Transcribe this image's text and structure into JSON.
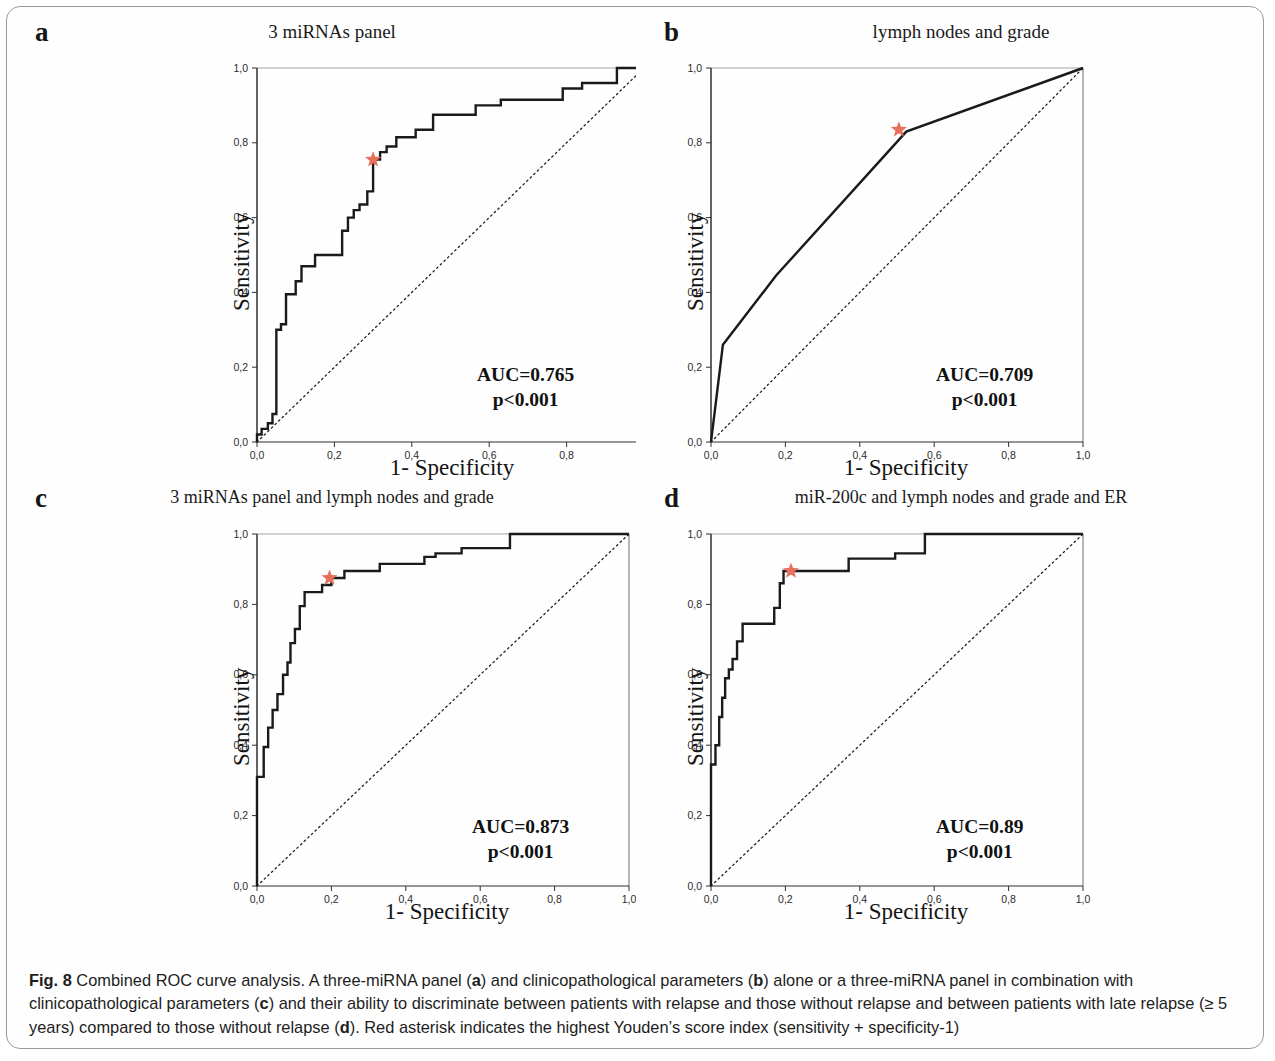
{
  "figure": {
    "caption_label": "Fig. 8",
    "caption_text_1": " Combined ROC curve analysis. A three-miRNA panel (",
    "caption_a": "a",
    "caption_text_2": ") and clinicopathological parameters (",
    "caption_b": "b",
    "caption_text_3": ") alone or a three-miRNA panel in combination with clinicopathological parameters (",
    "caption_c": "c",
    "caption_text_4": ") and their ability to discriminate between patients with relapse and those without relapse and between patients with late relapse (≥ 5 years) compared to those without relapse (",
    "caption_d": "d",
    "caption_text_5": "). Red asterisk indicates the highest Youden’s score index (sensitivity + specificity-1)",
    "asterisk_color": "#e8705a",
    "curve_color": "#1a1a1a",
    "axis_color": "#444444"
  },
  "axes_common": {
    "xlabel": "1- Specificity",
    "ylabel": "Sensitivity",
    "xticks": [
      "0,0",
      "0,2",
      "0,4",
      "0,6",
      "0,8",
      "1,0"
    ],
    "yticks": [
      "0,0",
      "0,2",
      "0,4",
      "0,6",
      "0,8",
      "1,0"
    ],
    "xlim": [
      0,
      1
    ],
    "ylim": [
      0,
      1
    ],
    "grid": false
  },
  "chart_data": [
    {
      "type": "line",
      "panel": "a",
      "letter": "a",
      "title": "3 miRNAs panel",
      "xlabel": "1- Specificity",
      "ylabel": "Sensitivity",
      "xlim": [
        0,
        1
      ],
      "ylim": [
        0,
        1
      ],
      "auc_label": "AUC=0.765",
      "p_label": "p<0.001",
      "auc": 0.765,
      "reference_line": [
        [
          0,
          0
        ],
        [
          1,
          1
        ]
      ],
      "youden_marker": {
        "x": 0.3,
        "y": 0.755
      },
      "series": [
        {
          "name": "ROC 3 miRNAs panel",
          "points": [
            [
              0.0,
              0.0
            ],
            [
              0.0,
              0.02
            ],
            [
              0.012,
              0.02
            ],
            [
              0.012,
              0.035
            ],
            [
              0.028,
              0.035
            ],
            [
              0.028,
              0.05
            ],
            [
              0.04,
              0.05
            ],
            [
              0.04,
              0.075
            ],
            [
              0.05,
              0.075
            ],
            [
              0.05,
              0.3
            ],
            [
              0.062,
              0.3
            ],
            [
              0.062,
              0.315
            ],
            [
              0.075,
              0.315
            ],
            [
              0.075,
              0.395
            ],
            [
              0.1,
              0.395
            ],
            [
              0.1,
              0.43
            ],
            [
              0.115,
              0.43
            ],
            [
              0.115,
              0.47
            ],
            [
              0.15,
              0.47
            ],
            [
              0.15,
              0.5
            ],
            [
              0.22,
              0.5
            ],
            [
              0.22,
              0.565
            ],
            [
              0.235,
              0.565
            ],
            [
              0.235,
              0.6
            ],
            [
              0.25,
              0.6
            ],
            [
              0.25,
              0.62
            ],
            [
              0.265,
              0.62
            ],
            [
              0.265,
              0.635
            ],
            [
              0.285,
              0.635
            ],
            [
              0.285,
              0.67
            ],
            [
              0.3,
              0.67
            ],
            [
              0.3,
              0.755
            ],
            [
              0.318,
              0.755
            ],
            [
              0.318,
              0.775
            ],
            [
              0.335,
              0.775
            ],
            [
              0.335,
              0.79
            ],
            [
              0.36,
              0.79
            ],
            [
              0.36,
              0.815
            ],
            [
              0.41,
              0.815
            ],
            [
              0.41,
              0.835
            ],
            [
              0.455,
              0.835
            ],
            [
              0.455,
              0.875
            ],
            [
              0.565,
              0.875
            ],
            [
              0.565,
              0.9
            ],
            [
              0.63,
              0.9
            ],
            [
              0.63,
              0.915
            ],
            [
              0.79,
              0.915
            ],
            [
              0.79,
              0.945
            ],
            [
              0.84,
              0.945
            ],
            [
              0.84,
              0.96
            ],
            [
              0.93,
              0.96
            ],
            [
              0.93,
              1.0
            ],
            [
              1.0,
              1.0
            ]
          ]
        }
      ]
    },
    {
      "type": "line",
      "panel": "b",
      "letter": "b",
      "title": "lymph nodes and grade",
      "xlabel": "1- Specificity",
      "ylabel": "Sensitivity",
      "xlim": [
        0,
        1
      ],
      "ylim": [
        0,
        1
      ],
      "auc_label": "AUC=0.709",
      "p_label": "p<0.001",
      "auc": 0.709,
      "reference_line": [
        [
          0,
          0
        ],
        [
          1,
          1
        ]
      ],
      "youden_marker": {
        "x": 0.505,
        "y": 0.835
      },
      "series": [
        {
          "name": "ROC lymph nodes and grade",
          "points": [
            [
              0.0,
              0.0
            ],
            [
              0.032,
              0.26
            ],
            [
              0.175,
              0.445
            ],
            [
              0.525,
              0.83
            ],
            [
              1.0,
              1.0
            ]
          ]
        }
      ]
    },
    {
      "type": "line",
      "panel": "c",
      "letter": "c",
      "title": "3 miRNAs panel and lymph nodes and grade",
      "xlabel": "1- Specificity",
      "ylabel": "Sensitivity",
      "xlim": [
        0,
        1
      ],
      "ylim": [
        0,
        1
      ],
      "auc_label": "AUC=0.873",
      "p_label": "p<0.001",
      "auc": 0.873,
      "reference_line": [
        [
          0,
          0
        ],
        [
          1,
          1
        ]
      ],
      "youden_marker": {
        "x": 0.195,
        "y": 0.875
      },
      "series": [
        {
          "name": "ROC 3 miRNAs panel and lymph nodes and grade",
          "points": [
            [
              0.0,
              0.0
            ],
            [
              0.0,
              0.31
            ],
            [
              0.018,
              0.31
            ],
            [
              0.018,
              0.395
            ],
            [
              0.03,
              0.395
            ],
            [
              0.03,
              0.45
            ],
            [
              0.042,
              0.45
            ],
            [
              0.042,
              0.5
            ],
            [
              0.055,
              0.5
            ],
            [
              0.055,
              0.545
            ],
            [
              0.07,
              0.545
            ],
            [
              0.07,
              0.6
            ],
            [
              0.082,
              0.6
            ],
            [
              0.082,
              0.635
            ],
            [
              0.09,
              0.635
            ],
            [
              0.09,
              0.69
            ],
            [
              0.102,
              0.69
            ],
            [
              0.102,
              0.73
            ],
            [
              0.115,
              0.73
            ],
            [
              0.115,
              0.795
            ],
            [
              0.128,
              0.795
            ],
            [
              0.128,
              0.835
            ],
            [
              0.175,
              0.835
            ],
            [
              0.175,
              0.855
            ],
            [
              0.2,
              0.855
            ],
            [
              0.2,
              0.875
            ],
            [
              0.235,
              0.875
            ],
            [
              0.235,
              0.895
            ],
            [
              0.33,
              0.895
            ],
            [
              0.33,
              0.915
            ],
            [
              0.45,
              0.915
            ],
            [
              0.45,
              0.935
            ],
            [
              0.48,
              0.935
            ],
            [
              0.48,
              0.945
            ],
            [
              0.55,
              0.945
            ],
            [
              0.55,
              0.96
            ],
            [
              0.68,
              0.96
            ],
            [
              0.68,
              1.0
            ],
            [
              1.0,
              1.0
            ]
          ]
        }
      ]
    },
    {
      "type": "line",
      "panel": "d",
      "letter": "d",
      "title": "miR-200c and lymph nodes and grade and ER",
      "xlabel": "1- Specificity",
      "ylabel": "Sensitivity",
      "xlim": [
        0,
        1
      ],
      "ylim": [
        0,
        1
      ],
      "auc_label": "AUC=0.89",
      "p_label": "p<0.001",
      "auc": 0.89,
      "reference_line": [
        [
          0,
          0
        ],
        [
          1,
          1
        ]
      ],
      "youden_marker": {
        "x": 0.215,
        "y": 0.895
      },
      "series": [
        {
          "name": "ROC miR-200c and lymph nodes and grade and ER",
          "points": [
            [
              0.0,
              0.0
            ],
            [
              0.0,
              0.345
            ],
            [
              0.012,
              0.345
            ],
            [
              0.012,
              0.4
            ],
            [
              0.022,
              0.4
            ],
            [
              0.022,
              0.48
            ],
            [
              0.03,
              0.48
            ],
            [
              0.03,
              0.535
            ],
            [
              0.038,
              0.535
            ],
            [
              0.038,
              0.59
            ],
            [
              0.048,
              0.59
            ],
            [
              0.048,
              0.615
            ],
            [
              0.058,
              0.615
            ],
            [
              0.058,
              0.645
            ],
            [
              0.07,
              0.645
            ],
            [
              0.07,
              0.695
            ],
            [
              0.085,
              0.695
            ],
            [
              0.085,
              0.745
            ],
            [
              0.17,
              0.745
            ],
            [
              0.17,
              0.79
            ],
            [
              0.185,
              0.79
            ],
            [
              0.185,
              0.86
            ],
            [
              0.195,
              0.86
            ],
            [
              0.195,
              0.895
            ],
            [
              0.37,
              0.895
            ],
            [
              0.37,
              0.93
            ],
            [
              0.495,
              0.93
            ],
            [
              0.495,
              0.945
            ],
            [
              0.575,
              0.945
            ],
            [
              0.575,
              1.0
            ],
            [
              1.0,
              1.0
            ]
          ]
        }
      ]
    }
  ]
}
